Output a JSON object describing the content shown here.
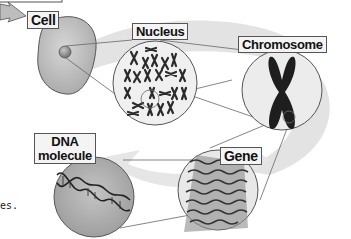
{
  "diagram": {
    "type": "biological-hierarchy",
    "flow": [
      "Cell",
      "Nucleus",
      "Chromosome",
      "Gene",
      "DNA molecule"
    ],
    "labels": {
      "cell": "Cell",
      "nucleus": "Nucleus",
      "chromosome": "Chromosome",
      "gene": "Gene",
      "dna_line1": "DNA",
      "dna_line2": "molecule"
    },
    "cut_text_fragment": "es.",
    "colors": {
      "background": "#ffffff",
      "swoosh": "#e2e2e2",
      "cell_fill": "#b8b8b8",
      "circle_fill": "#ececec",
      "stroke": "#555555",
      "chromosome": "#1e1e1e"
    }
  }
}
